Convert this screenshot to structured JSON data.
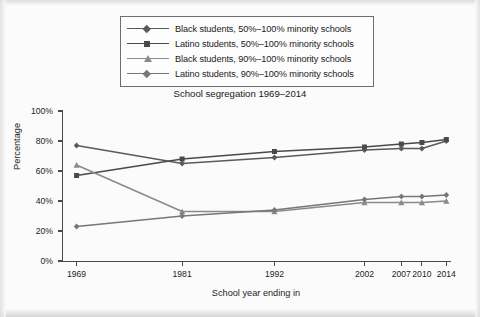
{
  "chart_data": {
    "type": "line",
    "title": "School segregation 1969–2014",
    "xlabel": "School year ending in",
    "ylabel": "Percentage",
    "categories": [
      "1969",
      "1981",
      "1992",
      "2002",
      "2007",
      "2010",
      "2014"
    ],
    "x_tick_labels": [
      "1969",
      "1981",
      "1992",
      "2002",
      "2007",
      "2010",
      "2014"
    ],
    "y_tick_labels": [
      "0%",
      "20%",
      "40%",
      "60%",
      "80%",
      "100%"
    ],
    "y_tick_values": [
      0,
      20,
      40,
      60,
      80,
      100
    ],
    "ylim": [
      0,
      100
    ],
    "grid": false,
    "legend_position": "top",
    "series": [
      {
        "name": "Black students, 50%–100% minority schools",
        "marker": "diamond",
        "color": "#5a5a5a",
        "values": [
          77,
          65,
          69,
          74,
          75,
          75,
          80
        ]
      },
      {
        "name": "Latino students, 50%–100% minority schools",
        "marker": "square",
        "color": "#4a4a4a",
        "values": [
          57,
          68,
          73,
          76,
          78,
          79,
          81
        ]
      },
      {
        "name": "Black students, 90%–100% minority schools",
        "marker": "triangle",
        "color": "#8a8a8a",
        "values": [
          64,
          33,
          33,
          39,
          39,
          39,
          40
        ]
      },
      {
        "name": "Latino students, 90%–100% minority schools",
        "marker": "diamond",
        "color": "#777777",
        "values": [
          23,
          30,
          34,
          41,
          43,
          43,
          44
        ]
      }
    ]
  },
  "legend": {
    "items": [
      {
        "label": "Black students, 50%–100% minority schools",
        "marker": "diamond",
        "color": "#5a5a5a"
      },
      {
        "label": "Latino students, 50%–100% minority schools",
        "marker": "square",
        "color": "#4a4a4a"
      },
      {
        "label": "Black students, 90%–100% minority schools",
        "marker": "triangle",
        "color": "#8a8a8a"
      },
      {
        "label": "Latino students, 90%–100% minority schools",
        "marker": "diamond",
        "color": "#777777"
      }
    ]
  }
}
